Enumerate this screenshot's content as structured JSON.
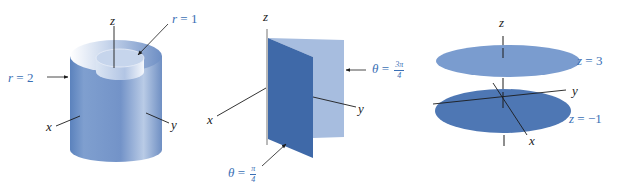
{
  "figure": {
    "panels": [
      {
        "id": "cylinders",
        "axes": {
          "z": "z",
          "x": "x",
          "y": "y"
        },
        "labels": {
          "inner": {
            "var": "r",
            "eq": "=",
            "value": "1"
          },
          "outer": {
            "var": "r",
            "eq": "=",
            "value": "2"
          }
        },
        "surfaces": [
          "cylinder r = 1",
          "cylinder r = 2"
        ]
      },
      {
        "id": "half-planes",
        "axes": {
          "z": "z",
          "x": "x",
          "y": "y"
        },
        "labels": {
          "back": {
            "var": "θ",
            "eq": "=",
            "num": "3π",
            "den": "4"
          },
          "front": {
            "var": "θ",
            "eq": "=",
            "num": "π",
            "den": "4"
          }
        },
        "surfaces": [
          "half-plane θ = π/4",
          "half-plane θ = 3π/4"
        ]
      },
      {
        "id": "planes",
        "axes": {
          "z": "z",
          "x": "x",
          "y": "y"
        },
        "labels": {
          "upper": {
            "var": "z",
            "eq": "=",
            "value": "3"
          },
          "lower": {
            "var": "z",
            "eq": "=",
            "value": "−1"
          }
        },
        "surfaces": [
          "plane z = 3",
          "plane z = −1"
        ]
      }
    ],
    "colors": {
      "surface_dark": "#3f69a8",
      "surface_mid": "#6e93c8",
      "surface_light": "#a9c0e0",
      "label_blue": "#3a6fb5",
      "axis": "#1c1c1c"
    }
  }
}
